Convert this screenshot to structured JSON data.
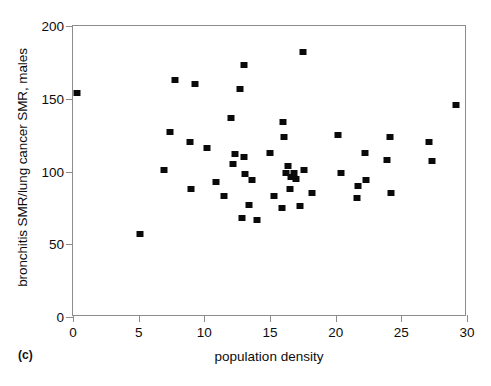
{
  "figure": {
    "panel_tag": "(c)"
  },
  "chart_data": {
    "type": "scatter",
    "title": "",
    "xlabel": "population density",
    "ylabel": "bronchitis SMR/lung cancer SMR, males",
    "xlim": [
      0,
      30
    ],
    "ylim": [
      0,
      200
    ],
    "xticks": [
      0,
      5,
      10,
      15,
      20,
      25,
      30
    ],
    "yticks": [
      0,
      50,
      100,
      150,
      200
    ],
    "xtick_labels": [
      "0",
      "5",
      "10",
      "15",
      "20",
      "25",
      "30"
    ],
    "ytick_labels": [
      "0",
      "50",
      "100",
      "150",
      "200"
    ],
    "grid": false,
    "legend": null,
    "marker": {
      "shape": "square",
      "color": "#0a0a0a",
      "size": 6
    },
    "points": [
      {
        "x": 0.3,
        "y": 154
      },
      {
        "x": 5.1,
        "y": 57
      },
      {
        "x": 6.9,
        "y": 101
      },
      {
        "x": 7.8,
        "y": 163
      },
      {
        "x": 7.4,
        "y": 127
      },
      {
        "x": 9.3,
        "y": 160
      },
      {
        "x": 8.9,
        "y": 120
      },
      {
        "x": 9.0,
        "y": 88
      },
      {
        "x": 10.2,
        "y": 116
      },
      {
        "x": 10.9,
        "y": 93
      },
      {
        "x": 11.5,
        "y": 83
      },
      {
        "x": 12.0,
        "y": 137
      },
      {
        "x": 12.7,
        "y": 157
      },
      {
        "x": 13.0,
        "y": 173
      },
      {
        "x": 12.2,
        "y": 105
      },
      {
        "x": 12.3,
        "y": 112
      },
      {
        "x": 13.0,
        "y": 110
      },
      {
        "x": 13.1,
        "y": 98
      },
      {
        "x": 12.9,
        "y": 68
      },
      {
        "x": 13.6,
        "y": 94
      },
      {
        "x": 13.4,
        "y": 77
      },
      {
        "x": 14.0,
        "y": 67
      },
      {
        "x": 15.0,
        "y": 113
      },
      {
        "x": 15.3,
        "y": 83
      },
      {
        "x": 15.9,
        "y": 75
      },
      {
        "x": 16.0,
        "y": 134
      },
      {
        "x": 16.1,
        "y": 124
      },
      {
        "x": 16.4,
        "y": 104
      },
      {
        "x": 16.2,
        "y": 99
      },
      {
        "x": 16.6,
        "y": 96
      },
      {
        "x": 16.8,
        "y": 99
      },
      {
        "x": 17.0,
        "y": 95
      },
      {
        "x": 16.5,
        "y": 88
      },
      {
        "x": 17.3,
        "y": 76
      },
      {
        "x": 17.5,
        "y": 182
      },
      {
        "x": 17.6,
        "y": 101
      },
      {
        "x": 18.2,
        "y": 85
      },
      {
        "x": 20.2,
        "y": 125
      },
      {
        "x": 20.4,
        "y": 99
      },
      {
        "x": 21.7,
        "y": 90
      },
      {
        "x": 21.6,
        "y": 82
      },
      {
        "x": 22.2,
        "y": 113
      },
      {
        "x": 22.3,
        "y": 94
      },
      {
        "x": 24.1,
        "y": 124
      },
      {
        "x": 23.9,
        "y": 108
      },
      {
        "x": 24.2,
        "y": 85
      },
      {
        "x": 27.1,
        "y": 120
      },
      {
        "x": 27.3,
        "y": 107
      },
      {
        "x": 29.2,
        "y": 146
      }
    ]
  }
}
